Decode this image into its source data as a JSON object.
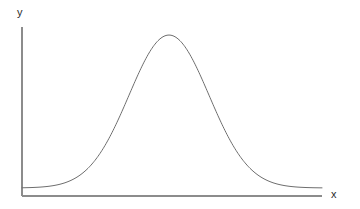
{
  "figure": {
    "name": "bell-curve-figure",
    "background_color": "#ffffff"
  },
  "axes": {
    "y": {
      "label": "y",
      "color": "#8c8c8c",
      "x_px": 22,
      "top_px": 27,
      "bottom_px": 196
    },
    "x": {
      "label": "x",
      "color": "#8c8c8c",
      "y_px": 196,
      "left_px": 22,
      "right_px": 322
    }
  },
  "chart_data": {
    "type": "line",
    "title": "",
    "subtitle": "",
    "xlabel": "x",
    "ylabel": "y",
    "grid": false,
    "legend": null,
    "annotations": [],
    "xticks": [],
    "yticks": [],
    "xticklabels": [],
    "yticklabels": [],
    "xlim": [
      0,
      300
    ],
    "ylim": [
      0,
      1.05
    ],
    "series": [
      {
        "name": "normal-distribution-curve",
        "color": "#6e6e6e",
        "linewidth": 1,
        "description": "bell-shaped (Gaussian) curve, peak near x=147 of 300, baseline at both ends",
        "curve": {
          "form": "gaussian",
          "peak_x": 147,
          "peak_y": 1.0,
          "sigma": 40,
          "baseline_y": 0.05
        },
        "x": [
          0,
          10,
          20,
          30,
          40,
          50,
          60,
          70,
          80,
          90,
          100,
          110,
          120,
          130,
          140,
          147,
          150,
          160,
          170,
          180,
          190,
          200,
          210,
          220,
          230,
          240,
          250,
          260,
          270,
          280,
          290,
          300
        ],
        "y": [
          0.05,
          0.053,
          0.059,
          0.07,
          0.088,
          0.116,
          0.157,
          0.216,
          0.295,
          0.394,
          0.509,
          0.631,
          0.748,
          0.849,
          0.926,
          0.953,
          0.974,
          0.991,
          0.972,
          0.914,
          0.824,
          0.712,
          0.592,
          0.474,
          0.367,
          0.276,
          0.202,
          0.147,
          0.108,
          0.082,
          0.066,
          0.056
        ]
      }
    ]
  }
}
